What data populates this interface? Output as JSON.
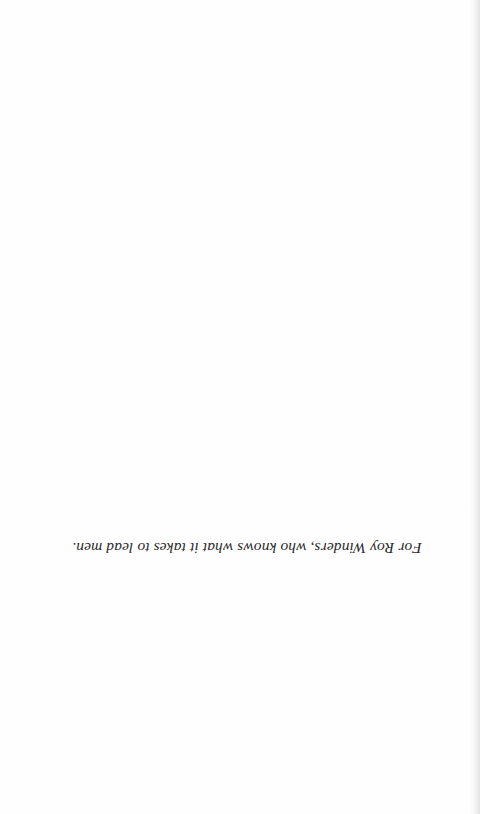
{
  "page": {
    "orientation": "rotated-180",
    "dedication": "For Roy Winders, who knows what it takes to lead men."
  }
}
